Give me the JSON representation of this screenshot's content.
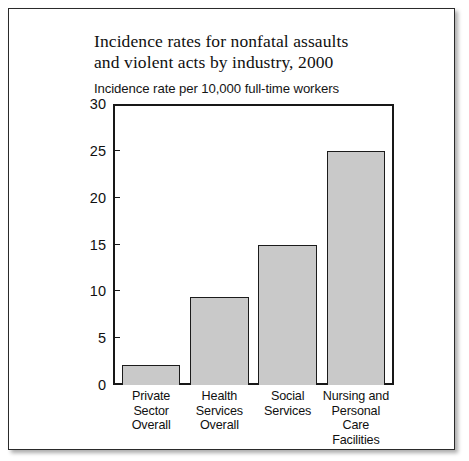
{
  "figure": {
    "title_line1": "Incidence rates for nonfatal assaults",
    "title_line2": "and violent acts by industry, 2000",
    "subtitle": "Incidence rate per 10,000 full-time workers"
  },
  "chart_data": {
    "type": "bar",
    "title": "Incidence rates for nonfatal assaults and violent acts by industry, 2000",
    "subtitle": "Incidence rate per 10,000 full-time workers",
    "xlabel": "",
    "ylabel": "Incidence rate per 10,000 full-time workers",
    "ylim": [
      0,
      30
    ],
    "yticks": [
      0,
      5,
      10,
      15,
      20,
      25,
      30
    ],
    "ytick_labels": [
      "0",
      "5",
      "10",
      "15",
      "20",
      "25",
      "30"
    ],
    "grid": false,
    "legend": false,
    "bar_color": "#c9c9c9",
    "bar_edge_color": "#1b1b1b",
    "categories": [
      "Private Sector Overall",
      "Health Services Overall",
      "Social Services",
      "Nursing and Personal Care Facilities"
    ],
    "category_lines": [
      [
        "Private",
        "Sector",
        "Overall"
      ],
      [
        "Health",
        "Services",
        "Overall"
      ],
      [
        "Social",
        "Services"
      ],
      [
        "Nursing and",
        "Personal",
        "Care",
        "Facilities"
      ]
    ],
    "values": [
      2.1,
      9.4,
      15.0,
      25.0
    ]
  }
}
